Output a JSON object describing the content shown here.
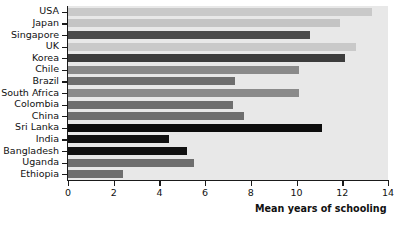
{
  "chart_data": {
    "type": "bar",
    "orientation": "horizontal",
    "title": "",
    "xlabel": "Mean years of schooling",
    "ylabel": "",
    "xlim": [
      0,
      14
    ],
    "xticks": [
      0,
      2,
      4,
      6,
      8,
      10,
      12,
      14
    ],
    "xtick_labels": [
      "0",
      "2",
      "4",
      "6",
      "8",
      "10",
      "12",
      "14"
    ],
    "grid": false,
    "legend": "none",
    "plot_background": "#e8e8e8",
    "categories": [
      "USA",
      "Japan",
      "Singapore",
      "UK",
      "Korea",
      "Chile",
      "Brazil",
      "South Africa",
      "Colombia",
      "China",
      "Sri Lanka",
      "India",
      "Bangladesh",
      "Uganda",
      "Ethiopia"
    ],
    "values": [
      13.3,
      11.9,
      10.6,
      12.6,
      12.1,
      10.1,
      7.3,
      10.1,
      7.2,
      7.7,
      11.1,
      4.4,
      5.2,
      5.5,
      2.4
    ],
    "bar_colors": [
      "#c9c9c9",
      "#c4c4c4",
      "#4a4a4a",
      "#c9c9c9",
      "#3c3c3c",
      "#8a8a8a",
      "#6e6e6e",
      "#8a8a8a",
      "#6e6e6e",
      "#6e6e6e",
      "#0d0d0d",
      "#111111",
      "#111111",
      "#6e6e6e",
      "#6e6e6e"
    ]
  }
}
